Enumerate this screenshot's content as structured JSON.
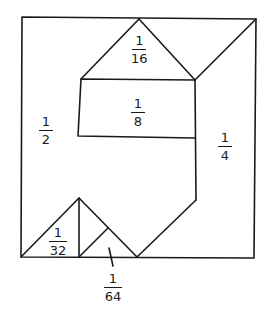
{
  "diagram": {
    "type": "area-decomposition",
    "stroke_color": "#1a1a1a",
    "background": "#ffffff",
    "labels": {
      "half": {
        "num": "1",
        "den": "2"
      },
      "quarter": {
        "num": "1",
        "den": "4"
      },
      "eighth": {
        "num": "1",
        "den": "8"
      },
      "sixteenth": {
        "num": "1",
        "den": "16"
      },
      "thirtysecond": {
        "num": "1",
        "den": "32"
      },
      "sixtyfourth": {
        "num": "1",
        "den": "64"
      }
    }
  }
}
